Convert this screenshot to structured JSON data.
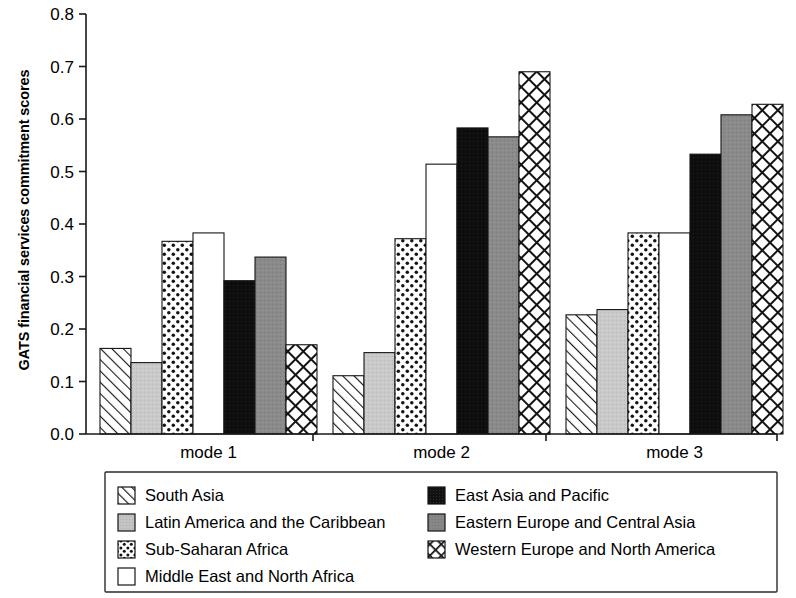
{
  "chart_data": {
    "type": "bar",
    "title": "",
    "xlabel": "",
    "ylabel": "GATS financial services commitment scores",
    "categories": [
      "mode 1",
      "mode 2",
      "mode 3"
    ],
    "ylim": [
      0.0,
      0.8
    ],
    "yticks": [
      "0.0",
      "0.1",
      "0.2",
      "0.3",
      "0.4",
      "0.5",
      "0.6",
      "0.7",
      "0.8"
    ],
    "ytick_values": [
      0.0,
      0.1,
      0.2,
      0.3,
      0.4,
      0.5,
      0.6,
      0.7,
      0.8
    ],
    "grid": false,
    "legend_position": "below-plot",
    "series": [
      {
        "name": "South Asia",
        "pattern": "diagonal-hatch",
        "color": "#ffffff",
        "values": [
          0.163,
          0.111,
          0.227
        ]
      },
      {
        "name": "Latin America and the Caribbean",
        "pattern": "light-gray",
        "color": "#c9c9c9",
        "values": [
          0.136,
          0.155,
          0.237
        ]
      },
      {
        "name": "Sub-Saharan Africa",
        "pattern": "dots",
        "color": "#ffffff",
        "values": [
          0.367,
          0.372,
          0.383
        ]
      },
      {
        "name": "Middle East and North Africa",
        "pattern": "white",
        "color": "#ffffff",
        "values": [
          0.383,
          0.514,
          0.383
        ]
      },
      {
        "name": "East Asia and Pacific",
        "pattern": "black",
        "color": "#0d0d0d",
        "values": [
          0.292,
          0.583,
          0.533
        ]
      },
      {
        "name": "Eastern Europe and Central Asia",
        "pattern": "medium-gray",
        "color": "#8a8a8a",
        "values": [
          0.337,
          0.566,
          0.608
        ]
      },
      {
        "name": "Western Europe and North America",
        "pattern": "cross-hatch",
        "color": "#ffffff",
        "values": [
          0.17,
          0.69,
          0.628
        ]
      }
    ]
  },
  "legend": {
    "left_column": [
      "South Asia",
      "Latin America and the Caribbean",
      "Sub-Saharan Africa",
      "Middle East and North Africa"
    ],
    "right_column": [
      "East Asia and Pacific",
      "Eastern Europe and Central Asia",
      "Western Europe and North America"
    ]
  }
}
